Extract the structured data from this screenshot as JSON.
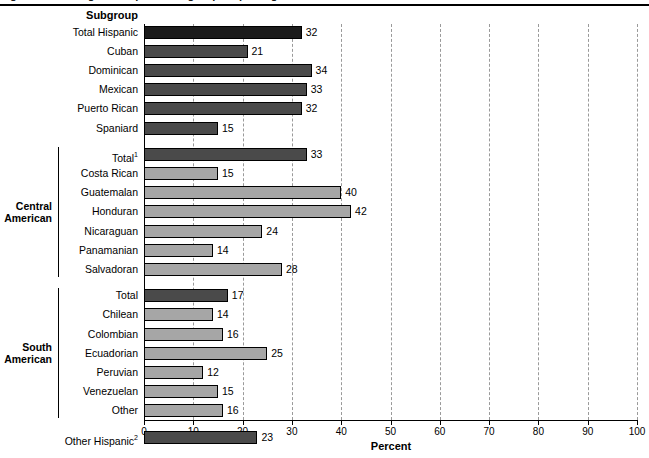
{
  "header": {
    "title_fragment": "Figure. Percentage of Hispanic subgroups reporting selected characteristic",
    "subgroup_header": "Subgroup"
  },
  "axis": {
    "title": "Percent",
    "ticks": [
      0,
      10,
      20,
      30,
      40,
      50,
      60,
      70,
      80,
      90,
      100
    ],
    "min": 0,
    "max": 100
  },
  "groups": [
    {
      "label_line1": "Central",
      "label_line2": "American"
    },
    {
      "label_line1": "South",
      "label_line2": "American"
    }
  ],
  "colors": {
    "dark": "#1b1b1b",
    "mid": "#4a4a4a",
    "light": "#a6a6a6",
    "grid": "#9a9a9a",
    "axis": "#000000"
  },
  "chart_data": {
    "type": "bar",
    "orientation": "horizontal",
    "title": "Figure. Percentage of Hispanic subgroups reporting selected characteristic",
    "xlabel": "Percent",
    "ylabel": "Subgroup",
    "xlim": [
      0,
      100
    ],
    "xticks": [
      0,
      10,
      20,
      30,
      40,
      50,
      60,
      70,
      80,
      90,
      100
    ],
    "grid": "vertical-dashed",
    "legend": "none",
    "categories": [
      "Total Hispanic",
      "Cuban",
      "Dominican",
      "Mexican",
      "Puerto Rican",
      "Spaniard",
      "Total¹",
      "Costa Rican",
      "Guatemalan",
      "Honduran",
      "Nicaraguan",
      "Panamanian",
      "Salvadoran",
      "Total",
      "Chilean",
      "Colombian",
      "Ecuadorian",
      "Peruvian",
      "Venezuelan",
      "Other",
      "Other Hispanic²"
    ],
    "values": [
      32,
      21,
      34,
      33,
      32,
      15,
      33,
      15,
      40,
      42,
      24,
      14,
      28,
      17,
      14,
      16,
      25,
      12,
      15,
      16,
      23
    ],
    "bars": [
      {
        "label": "Total Hispanic",
        "value": 32,
        "shade": "dark",
        "group": null,
        "gap_before": false
      },
      {
        "label": "Cuban",
        "value": 21,
        "shade": "mid",
        "group": null,
        "gap_before": false
      },
      {
        "label": "Dominican",
        "value": 34,
        "shade": "mid",
        "group": null,
        "gap_before": false
      },
      {
        "label": "Mexican",
        "value": 33,
        "shade": "mid",
        "group": null,
        "gap_before": false
      },
      {
        "label": "Puerto Rican",
        "value": 32,
        "shade": "mid",
        "group": null,
        "gap_before": false
      },
      {
        "label": "Spaniard",
        "value": 15,
        "shade": "mid",
        "group": null,
        "gap_before": false
      },
      {
        "label": "Total",
        "value": 33,
        "shade": "mid",
        "group": "Central American",
        "gap_before": true,
        "footnote": "1"
      },
      {
        "label": "Costa Rican",
        "value": 15,
        "shade": "light",
        "group": "Central American",
        "gap_before": false
      },
      {
        "label": "Guatemalan",
        "value": 40,
        "shade": "light",
        "group": "Central American",
        "gap_before": false
      },
      {
        "label": "Honduran",
        "value": 42,
        "shade": "light",
        "group": "Central American",
        "gap_before": false
      },
      {
        "label": "Nicaraguan",
        "value": 24,
        "shade": "light",
        "group": "Central American",
        "gap_before": false
      },
      {
        "label": "Panamanian",
        "value": 14,
        "shade": "light",
        "group": "Central American",
        "gap_before": false
      },
      {
        "label": "Salvadoran",
        "value": 28,
        "shade": "light",
        "group": "Central American",
        "gap_before": false
      },
      {
        "label": "Total",
        "value": 17,
        "shade": "mid",
        "group": "South American",
        "gap_before": true
      },
      {
        "label": "Chilean",
        "value": 14,
        "shade": "light",
        "group": "South American",
        "gap_before": false
      },
      {
        "label": "Colombian",
        "value": 16,
        "shade": "light",
        "group": "South American",
        "gap_before": false
      },
      {
        "label": "Ecuadorian",
        "value": 25,
        "shade": "light",
        "group": "South American",
        "gap_before": false
      },
      {
        "label": "Peruvian",
        "value": 12,
        "shade": "light",
        "group": "South American",
        "gap_before": false
      },
      {
        "label": "Venezuelan",
        "value": 15,
        "shade": "light",
        "group": "South American",
        "gap_before": false
      },
      {
        "label": "Other",
        "value": 16,
        "shade": "light",
        "group": "South American",
        "gap_before": false
      },
      {
        "label": "Other Hispanic",
        "value": 23,
        "shade": "mid",
        "group": null,
        "gap_before": true,
        "footnote": "2"
      }
    ]
  }
}
